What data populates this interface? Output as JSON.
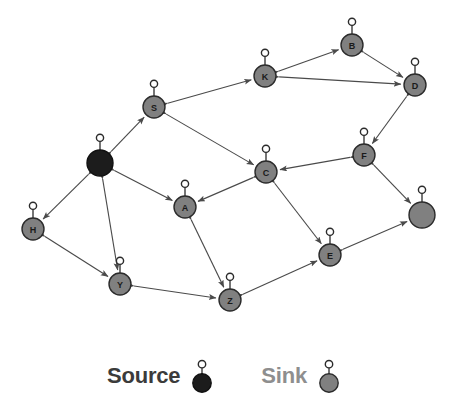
{
  "figure": {
    "type": "directed-graph-diagram",
    "background_color": "#ffffff",
    "node_sink_color": "#808080",
    "node_source_color": "#1c1c1c",
    "edge_color": "#4a4a4a",
    "node_outline_color": "#2b2b2b"
  },
  "legend": {
    "source": {
      "label": "Source",
      "text_color": "#3b3b3b",
      "swatch_color": "#1c1c1c",
      "swatch_icon": "source-node-glyph"
    },
    "sink": {
      "label": "Sink",
      "text_color": "#8e8e8e",
      "swatch_color": "#808080",
      "swatch_icon": "sink-node-glyph"
    }
  },
  "graph_data": {
    "type": "graph",
    "directed": true,
    "node_count": 13,
    "edge_count": 19,
    "nodes": [
      {
        "id": "source",
        "label": "",
        "role": "source",
        "color": "#1c1c1c",
        "x": 100,
        "y": 163,
        "r": 13
      },
      {
        "id": "S",
        "label": "S",
        "role": "sink",
        "color": "#808080",
        "x": 154,
        "y": 107,
        "r": 11
      },
      {
        "id": "H",
        "label": "H",
        "role": "sink",
        "color": "#808080",
        "x": 33,
        "y": 229,
        "r": 11
      },
      {
        "id": "Y",
        "label": "Y",
        "role": "sink",
        "color": "#808080",
        "x": 120,
        "y": 284,
        "r": 11
      },
      {
        "id": "A",
        "label": "A",
        "role": "sink",
        "color": "#808080",
        "x": 185,
        "y": 207,
        "r": 11
      },
      {
        "id": "Z",
        "label": "Z",
        "role": "sink",
        "color": "#808080",
        "x": 230,
        "y": 300,
        "r": 11
      },
      {
        "id": "C",
        "label": "C",
        "role": "sink",
        "color": "#808080",
        "x": 266,
        "y": 172,
        "r": 11
      },
      {
        "id": "K",
        "label": "K",
        "role": "sink",
        "color": "#808080",
        "x": 265,
        "y": 76,
        "r": 11
      },
      {
        "id": "B",
        "label": "B",
        "role": "sink",
        "color": "#808080",
        "x": 352,
        "y": 45,
        "r": 11
      },
      {
        "id": "D",
        "label": "D",
        "role": "sink",
        "color": "#808080",
        "x": 415,
        "y": 85,
        "r": 11
      },
      {
        "id": "F",
        "label": "F",
        "role": "sink",
        "color": "#808080",
        "x": 364,
        "y": 155,
        "r": 11
      },
      {
        "id": "E",
        "label": "E",
        "role": "sink",
        "color": "#808080",
        "x": 330,
        "y": 255,
        "r": 11
      },
      {
        "id": "U1",
        "label": "",
        "role": "sink",
        "color": "#808080",
        "x": 422,
        "y": 215,
        "r": 13
      }
    ],
    "edges": [
      {
        "from": "source",
        "to": "S",
        "bidirectional": true
      },
      {
        "from": "source",
        "to": "H",
        "bidirectional": true
      },
      {
        "from": "source",
        "to": "Y",
        "bidirectional": true
      },
      {
        "from": "source",
        "to": "A",
        "bidirectional": true
      },
      {
        "from": "S",
        "to": "C",
        "bidirectional": true
      },
      {
        "from": "S",
        "to": "K",
        "bidirectional": true
      },
      {
        "from": "K",
        "to": "B",
        "bidirectional": true
      },
      {
        "from": "K",
        "to": "D",
        "bidirectional": true
      },
      {
        "from": "B",
        "to": "D",
        "bidirectional": true
      },
      {
        "from": "D",
        "to": "F",
        "bidirectional": true
      },
      {
        "from": "F",
        "to": "C",
        "bidirectional": true
      },
      {
        "from": "F",
        "to": "U1",
        "bidirectional": true
      },
      {
        "from": "C",
        "to": "A",
        "bidirectional": true
      },
      {
        "from": "C",
        "to": "E",
        "bidirectional": true
      },
      {
        "from": "A",
        "to": "Z",
        "bidirectional": true
      },
      {
        "from": "H",
        "to": "Y",
        "bidirectional": true
      },
      {
        "from": "Y",
        "to": "Z",
        "bidirectional": true
      },
      {
        "from": "Z",
        "to": "E",
        "bidirectional": true
      },
      {
        "from": "E",
        "to": "U1",
        "bidirectional": true
      }
    ]
  }
}
